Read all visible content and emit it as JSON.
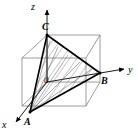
{
  "figure": {
    "background_color": "#ffffff",
    "stroke_color": "#000000",
    "thin_stroke_color": "#555555",
    "hatch_color": "#555555",
    "axes": [
      {
        "name": "z-axis",
        "label": "z",
        "direction": "up"
      },
      {
        "name": "y-axis",
        "label": "y",
        "direction": "right"
      },
      {
        "name": "x-axis",
        "label": "x",
        "direction": "down-left"
      }
    ],
    "origin": {
      "label": "0",
      "x": 46,
      "y": 80
    },
    "vertices": [
      {
        "name": "A",
        "label": "A",
        "x": 30,
        "y": 112,
        "note": "on x-axis"
      },
      {
        "name": "B",
        "label": "B",
        "x": 100,
        "y": 73,
        "note": "on y-axis"
      },
      {
        "name": "C",
        "label": "C",
        "x": 47,
        "y": 35,
        "note": "on z-axis"
      }
    ],
    "triangle": {
      "name": "triangle-ABC",
      "points": "47,35 100,73 30,112",
      "hatched": true,
      "hatch_angle_deg": 35,
      "hatch_spacing": 6
    },
    "cube": {
      "name": "cube-wireframe",
      "front_face": "22,58 86,58 86,106 22,106",
      "back_face": "47,35 100,35 100,82 47,82",
      "connectors": [
        {
          "from": "22,58",
          "to": "47,35"
        },
        {
          "from": "86,58",
          "to": "100,35"
        },
        {
          "from": "86,106",
          "to": "100,82"
        },
        {
          "from": "22,106",
          "to": "47,82"
        }
      ]
    },
    "axis_lines": {
      "z": {
        "from": "47,82",
        "to": "47,8"
      },
      "y": {
        "from": "47,82",
        "to": "126,69"
      },
      "x": {
        "from": "47,82",
        "to": "14,124"
      }
    }
  }
}
